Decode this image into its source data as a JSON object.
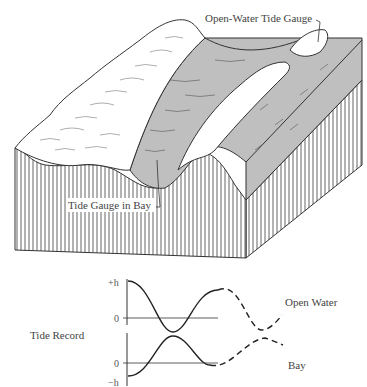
{
  "diagram": {
    "type": "block diagram with tide record",
    "colors": {
      "water": "#bfbfbf",
      "land": "#ffffff",
      "line": "#333333",
      "hatch": "#555555"
    },
    "labels": {
      "open_water_gauge": "Open-Water Tide Gauge",
      "bay_gauge": "Tide Gauge in Bay"
    }
  },
  "tide_record": {
    "title": "Tide Record",
    "axis_ticks": {
      "plus_h": "+h",
      "zero_top": "0",
      "zero_bottom": "0",
      "minus_h": "−h"
    },
    "series": [
      {
        "name": "Open Water",
        "label": "Open Water"
      },
      {
        "name": "Bay",
        "label": "Bay"
      }
    ]
  }
}
